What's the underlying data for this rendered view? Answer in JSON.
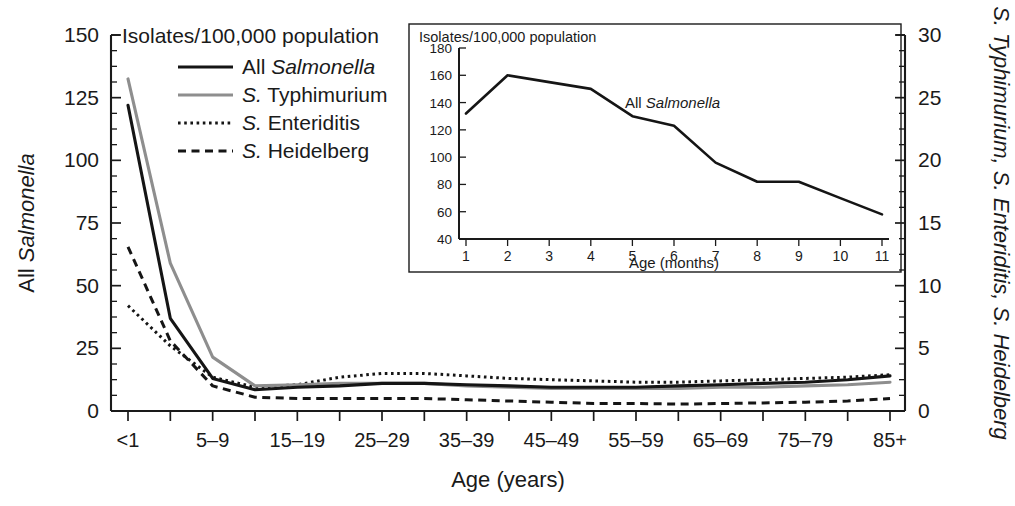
{
  "figure": {
    "background": "#ffffff",
    "line_colors": {
      "all_salmonella": "#151515",
      "typhimurium": "#8e8e8e",
      "enteriditis": "#151515",
      "heidelberg": "#151515"
    }
  },
  "main": {
    "header": "Isolates/100,000 population",
    "y_left_title_plain": "All ",
    "y_left_title_italic": "Salmonella",
    "y_right_title": "S. Typhimurium, S. Enteriditis, S. Heidelberg",
    "x_title": "Age (years)",
    "y_left_ticks": [
      "0",
      "25",
      "50",
      "75",
      "100",
      "125",
      "150"
    ],
    "y_right_ticks": [
      "0",
      "5",
      "10",
      "15",
      "20",
      "25",
      "30"
    ],
    "x_tick_labels": [
      "<1",
      "",
      "5–9",
      "",
      "15–19",
      "",
      "25–29",
      "",
      "35–39",
      "",
      "45–49",
      "",
      "55–59",
      "",
      "65–69",
      "",
      "75–79",
      "",
      "85+"
    ],
    "legend": [
      {
        "label_plain": "All ",
        "label_italic": "Salmonella",
        "style": "solid",
        "color": "#151515",
        "name": "all-salmonella"
      },
      {
        "label_plain": "S.",
        "label_italic": " Typhimurium",
        "style": "solid",
        "color": "#8e8e8e",
        "name": "s-typhimurium"
      },
      {
        "label_plain": "S.",
        "label_italic": " Enteriditis",
        "style": "dotted",
        "color": "#151515",
        "name": "s-enteriditis"
      },
      {
        "label_plain": "S.",
        "label_italic": " Heidelberg",
        "style": "dashed",
        "color": "#151515",
        "name": "s-heidelberg"
      }
    ]
  },
  "inset": {
    "header": "Isolates/100,000 population",
    "x_title": "Age (months)",
    "annotation_plain": "All ",
    "annotation_italic": "Salmonella",
    "y_ticks": [
      "40",
      "60",
      "80",
      "100",
      "120",
      "140",
      "160",
      "180"
    ],
    "x_ticks": [
      "1",
      "2",
      "3",
      "4",
      "5",
      "6",
      "7",
      "8",
      "9",
      "10",
      "11"
    ]
  },
  "chart_data": [
    {
      "type": "line",
      "id": "main-age-years",
      "title": "Isolates/100,000 population",
      "xlabel": "Age (years)",
      "ylabel": "All Salmonella",
      "ylabel_right": "S. Typhimurium, S. Enteriditis, S. Heidelberg",
      "categories": [
        "<1",
        "1–4",
        "5–9",
        "10–14",
        "15–19",
        "20–24",
        "25–29",
        "30–34",
        "35–39",
        "40–44",
        "45–49",
        "50–54",
        "55–59",
        "60–64",
        "65–69",
        "70–74",
        "75–79",
        "80–84",
        "85+"
      ],
      "ylim": [
        0,
        150
      ],
      "ylim_right": [
        0,
        30
      ],
      "yticks": [
        0,
        25,
        50,
        75,
        100,
        125,
        150
      ],
      "yticks_right": [
        0,
        5,
        10,
        15,
        20,
        25,
        30
      ],
      "grid": false,
      "legend_position": "top-left",
      "series": [
        {
          "name": "All Salmonella",
          "axis": "left",
          "style": "solid",
          "color": "#151515",
          "values": [
            122,
            37,
            13,
            8.5,
            9.5,
            10,
            11,
            11,
            10.5,
            10,
            9.5,
            9.5,
            9.5,
            10,
            10.5,
            11,
            11.5,
            12.5,
            14
          ]
        },
        {
          "name": "S. Typhimurium",
          "axis": "right",
          "style": "solid",
          "color": "#8e8e8e",
          "values": [
            26.5,
            11.8,
            4.3,
            2.0,
            2.1,
            2.2,
            2.2,
            2.2,
            2.0,
            1.9,
            1.8,
            1.8,
            1.8,
            1.8,
            1.9,
            1.9,
            2.0,
            2.1,
            2.3
          ]
        },
        {
          "name": "S. Enteriditis",
          "axis": "right",
          "style": "dotted",
          "color": "#151515",
          "values": [
            8.4,
            5.2,
            2.7,
            1.9,
            2.1,
            2.7,
            3.0,
            3.0,
            2.8,
            2.6,
            2.5,
            2.4,
            2.3,
            2.3,
            2.4,
            2.5,
            2.6,
            2.7,
            2.9
          ]
        },
        {
          "name": "S. Heidelberg",
          "axis": "right",
          "style": "dashed",
          "color": "#151515",
          "values": [
            13.1,
            5.6,
            2.0,
            1.1,
            1.0,
            1.0,
            1.0,
            1.0,
            0.9,
            0.8,
            0.7,
            0.6,
            0.6,
            0.55,
            0.6,
            0.65,
            0.7,
            0.8,
            1.0
          ]
        }
      ]
    },
    {
      "type": "line",
      "id": "inset-age-months",
      "title": "Isolates/100,000 population",
      "xlabel": "Age (months)",
      "ylabel": "",
      "x": [
        1,
        2,
        3,
        4,
        5,
        6,
        7,
        8,
        9,
        10,
        11
      ],
      "ylim": [
        40,
        180
      ],
      "yticks": [
        40,
        60,
        80,
        100,
        120,
        140,
        160,
        180
      ],
      "grid": false,
      "annotation": "All Salmonella",
      "series": [
        {
          "name": "All Salmonella",
          "style": "solid",
          "color": "#151515",
          "values": [
            132,
            160,
            155,
            150,
            130,
            123,
            96,
            82,
            82,
            70,
            58
          ]
        }
      ]
    }
  ]
}
